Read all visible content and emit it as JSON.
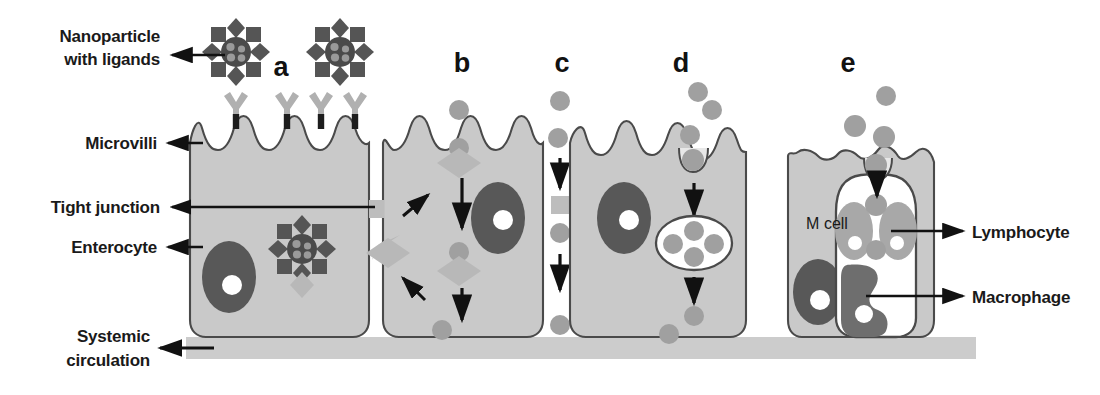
{
  "figure": {
    "background": "#ffffff"
  },
  "colors": {
    "cell_fill": "#c9c9c9",
    "cell_stroke": "#4a4a4a",
    "nucleus": "#585858",
    "nucleolus": "#ffffff",
    "particle": "#a0a0a0",
    "ligand_light": "#b0b0b0",
    "ligand_dark": "#555555",
    "core_dark": "#4b4b4b",
    "core_dot": "#9a9a9a",
    "tight_junction": "#bdbdbd",
    "systemic_band": "#cccccc",
    "arrow": "#111111",
    "text": "#1a1a1a",
    "lymphocyte": "#a8a8a8",
    "macrophage": "#6e6e6e",
    "mcell_fill": "#c9c9c9"
  },
  "labels": {
    "nanoparticle": {
      "line1": "Nanoparticle",
      "line2": "with ligands",
      "x": 155,
      "y": 38
    },
    "microvilli": {
      "text": "Microvilli",
      "x": 155,
      "y": 143
    },
    "tight_junction": {
      "text": "Tight junction",
      "x": 155,
      "y": 209
    },
    "enterocyte": {
      "text": "Enterocyte",
      "x": 155,
      "y": 249
    },
    "systemic": {
      "line1": "Systemic",
      "line2": "circulation",
      "x": 150,
      "y": 338
    },
    "lymphocyte": {
      "text": "Lymphocyte",
      "x": 975,
      "y": 235
    },
    "macrophage": {
      "text": "Macrophage",
      "x": 975,
      "y": 299
    },
    "m_cell": {
      "text": "M cell",
      "x": 827,
      "y": 228
    }
  },
  "panels": [
    {
      "id": "a",
      "letter": "a",
      "x": 281,
      "y": 76,
      "mechanism": "Ligand-mediated binding of nanoparticles to microvilli receptors"
    },
    {
      "id": "b",
      "letter": "b",
      "x": 462,
      "y": 72,
      "mechanism": "Receptor-mediated transcytosis / carrier-mediated transport"
    },
    {
      "id": "c",
      "letter": "c",
      "x": 562,
      "y": 72,
      "mechanism": "Paracellular transport through opened tight junction"
    },
    {
      "id": "d",
      "letter": "d",
      "x": 681,
      "y": 72,
      "mechanism": "Endocytosis into vesicle and basolateral release"
    },
    {
      "id": "e",
      "letter": "e",
      "x": 848,
      "y": 72,
      "mechanism": "M cell uptake and delivery to lymphocytes and macrophages"
    }
  ],
  "legend_shapes": {
    "nanoparticle_core": "dark circle with pale internal dots",
    "ligand_diamond": "diamond",
    "ligand_square": "square",
    "receptor": "Y-shaped receptor",
    "particle": "grey circle"
  }
}
